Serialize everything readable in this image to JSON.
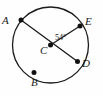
{
  "figure": {
    "kind": "circle-with-central-angle",
    "background_color": "#fefefe",
    "stroke_color": "#1a1a1a",
    "point_color": "#111111",
    "circle": {
      "center_label": "C",
      "cx": 50.5,
      "cy": 45,
      "r": 38,
      "stroke_width": 1.3
    },
    "points": [
      {
        "id": "A",
        "label": "A",
        "x": 21,
        "y": 20,
        "label_x": 2,
        "label_y": 15
      },
      {
        "id": "B",
        "label": "B",
        "x": 34,
        "y": 72.5,
        "label_x": 31,
        "label_y": 77
      },
      {
        "id": "C",
        "label": "C",
        "x": 50.5,
        "y": 45,
        "label_x": 40,
        "label_y": 45
      },
      {
        "id": "D",
        "label": "D",
        "x": 77.5,
        "y": 61.5,
        "label_x": 82,
        "label_y": 58
      },
      {
        "id": "E",
        "label": "E",
        "x": 80,
        "y": 26,
        "label_x": 85,
        "label_y": 16
      }
    ],
    "segments": [
      {
        "id": "AD",
        "from": "A",
        "to": "D",
        "through_center": true
      },
      {
        "id": "CE",
        "from": "C",
        "to": "E",
        "through_center": false
      }
    ],
    "angles": [
      {
        "id": "ECD",
        "vertex": "C",
        "ray_1": "E",
        "ray_2": "D",
        "value": "54",
        "unit": "°",
        "text": "54°",
        "label_x": 55,
        "label_y": 34
      }
    ],
    "labels": {
      "A": "A",
      "B": "B",
      "C": "C",
      "D": "D",
      "E": "E",
      "angle_ECD": "54°"
    }
  }
}
